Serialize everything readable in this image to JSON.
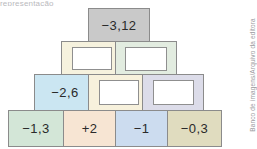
{
  "page": {
    "top_clipped_text": "representação",
    "credit": "Banco de imagens/Arquivo da editora"
  },
  "pyramid": {
    "description": "Addition pyramid with four rows of blocks; some blocks show numbers and others contain empty white answer boxes.",
    "rows": [
      {
        "row": 1,
        "blocks": [
          {
            "name": "apex",
            "value": "−3,12",
            "filled": true,
            "color": "#c9c9c9"
          }
        ]
      },
      {
        "row": 2,
        "blocks": [
          {
            "name": "r2c1",
            "value": "",
            "filled": false,
            "color": "#f6f2de"
          },
          {
            "name": "r2c2",
            "value": "",
            "filled": false,
            "color": "#e2ece0"
          }
        ]
      },
      {
        "row": 3,
        "blocks": [
          {
            "name": "r3c1",
            "value": "−2,6",
            "filled": true,
            "color": "#cbe6f2"
          },
          {
            "name": "r3c2",
            "value": "",
            "filled": false,
            "color": "#f7f1dc"
          },
          {
            "name": "r3c3",
            "value": "",
            "filled": false,
            "color": "#dcdce9"
          }
        ]
      },
      {
        "row": 4,
        "blocks": [
          {
            "name": "r4c1",
            "value": "−1,3",
            "filled": true,
            "color": "#d3e6d7"
          },
          {
            "name": "r4c2",
            "value": "+2",
            "filled": true,
            "color": "#f7e5d3"
          },
          {
            "name": "r4c3",
            "value": "−1",
            "filled": true,
            "color": "#ccdcef"
          },
          {
            "name": "r4c4",
            "value": "−0,3",
            "filled": true,
            "color": "#e0dcbf"
          }
        ]
      }
    ]
  }
}
